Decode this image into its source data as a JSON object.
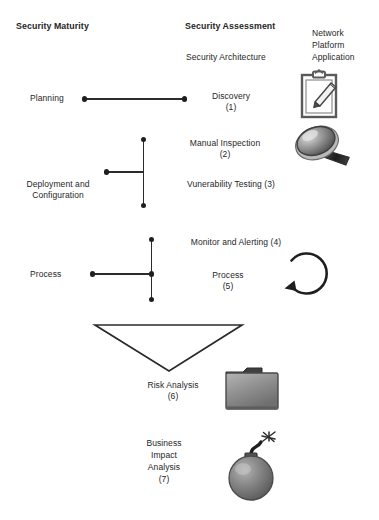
{
  "diagram": {
    "title_columns": {
      "security_maturity": "Security Maturity",
      "security_assessment": "Security Assessment",
      "scope": "Network\nPlatform\nApplication"
    },
    "subheading": "Security Architecture",
    "maturity_stages": [
      {
        "label": "Planning"
      },
      {
        "label": "Deployment and\nConfiguration"
      },
      {
        "label": "Process"
      }
    ],
    "assessment_items": [
      {
        "label": "Discovery\n(1)",
        "number": "1",
        "name": "Discovery"
      },
      {
        "label": "Manual Inspection\n(2)",
        "number": "2",
        "name": "Manual Inspection"
      },
      {
        "label": "Vunerability Testing (3)",
        "number": "3",
        "name": "Vunerability Testing"
      },
      {
        "label": "Monitor and Alerting (4)",
        "number": "4",
        "name": "Monitor and Alerting"
      },
      {
        "label": "Process\n(5)",
        "number": "5",
        "name": "Process"
      },
      {
        "label": "Risk Analysis\n(6)",
        "number": "6",
        "name": "Risk Analysis"
      },
      {
        "label": "Business\nImpact\nAnalysis\n(7)",
        "number": "7",
        "name": "Business Impact Analysis"
      }
    ],
    "icons": [
      {
        "name": "clipboard-icon",
        "for": "Discovery (1)"
      },
      {
        "name": "magnifying-glass-icon",
        "for": "Manual Inspection (2)"
      },
      {
        "name": "circular-arrow-icon",
        "for": "Process (5)"
      },
      {
        "name": "folder-icon",
        "for": "Risk Analysis (6)"
      },
      {
        "name": "bomb-icon",
        "for": "Business Impact Analysis (7)"
      }
    ],
    "colors": {
      "line": "#2b2b2b",
      "text": "#262626",
      "background": "#ffffff",
      "icon_gray": "#8f8f8f",
      "icon_dark": "#3a3a3a"
    }
  }
}
